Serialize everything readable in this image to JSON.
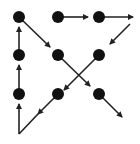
{
  "diagram": {
    "colors": {
      "background": "#ffffff",
      "dot": "#111111",
      "line": "#222222"
    },
    "dot_radius": 6,
    "dots": [
      {
        "id": "r1c1",
        "x": 19,
        "y": 17
      },
      {
        "id": "r1c2",
        "x": 58,
        "y": 17
      },
      {
        "id": "r1c3",
        "x": 99,
        "y": 17
      },
      {
        "id": "r2c1",
        "x": 19,
        "y": 55
      },
      {
        "id": "r2c2",
        "x": 58,
        "y": 55
      },
      {
        "id": "r2c3",
        "x": 99,
        "y": 55
      },
      {
        "id": "r3c1",
        "x": 19,
        "y": 94
      },
      {
        "id": "r3c2",
        "x": 58,
        "y": 94
      },
      {
        "id": "r3c3",
        "x": 99,
        "y": 94
      }
    ],
    "arrows": [
      {
        "x1": 58,
        "y1": 17,
        "x2": 88,
        "y2": 17
      },
      {
        "x1": 99,
        "y1": 17,
        "x2": 133,
        "y2": 17
      },
      {
        "x1": 130,
        "y1": 24,
        "x2": 110,
        "y2": 44
      },
      {
        "x1": 99,
        "y1": 55,
        "x2": 64,
        "y2": 90
      },
      {
        "x1": 58,
        "y1": 94,
        "x2": 38,
        "y2": 114
      },
      {
        "x1": 38,
        "y1": 114,
        "x2": 19,
        "y2": 134,
        "head": false
      },
      {
        "x1": 19,
        "y1": 134,
        "x2": 19,
        "y2": 104
      },
      {
        "x1": 19,
        "y1": 94,
        "x2": 19,
        "y2": 65
      },
      {
        "x1": 19,
        "y1": 55,
        "x2": 19,
        "y2": 27
      },
      {
        "x1": 19,
        "y1": 17,
        "x2": 50,
        "y2": 47
      },
      {
        "x1": 58,
        "y1": 55,
        "x2": 90,
        "y2": 86
      },
      {
        "x1": 99,
        "y1": 94,
        "x2": 122,
        "y2": 117
      }
    ]
  }
}
